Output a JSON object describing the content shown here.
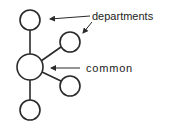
{
  "diagram": {
    "title": "",
    "colors": {
      "stroke": "#2a2a2a",
      "text": "#222222",
      "background": "#ffffff"
    },
    "nodes": [
      {
        "id": "top",
        "role": "department",
        "cx": 30,
        "cy": 20,
        "r": 10
      },
      {
        "id": "upper-right",
        "role": "department",
        "cx": 70,
        "cy": 42,
        "r": 10
      },
      {
        "id": "center",
        "role": "common",
        "cx": 30,
        "cy": 67,
        "r": 13
      },
      {
        "id": "lower-right",
        "role": "department",
        "cx": 70,
        "cy": 86,
        "r": 10
      },
      {
        "id": "bottom",
        "role": "department",
        "cx": 30,
        "cy": 110,
        "r": 10
      }
    ],
    "edges": [
      {
        "from": "center",
        "to": "top"
      },
      {
        "from": "center",
        "to": "upper-right"
      },
      {
        "from": "center",
        "to": "lower-right"
      },
      {
        "from": "center",
        "to": "bottom"
      }
    ],
    "labels": {
      "departments": "departments",
      "common": "common"
    }
  }
}
